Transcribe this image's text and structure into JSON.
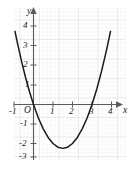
{
  "figure": {
    "background_color": "#ffffff",
    "grid_minor_color": "#e8e8e8",
    "grid_major_color": "#d0d0d0",
    "axis_color": "#5a5a5a",
    "curve_color": "#1a1a1a"
  },
  "chart_data": {
    "type": "line",
    "title": "",
    "subtitle": "",
    "xlabel": "x",
    "ylabel": "y",
    "origin_label": "O",
    "xlim": [
      -1.35,
      4.55
    ],
    "ylim": [
      -3.2,
      4.7
    ],
    "grid": true,
    "grid_minor_step": 0.2,
    "grid_major_step": 1,
    "legend": "none",
    "x_ticks": [
      -1,
      1,
      2,
      3,
      4
    ],
    "x_tick_labels": [
      "-1",
      "1",
      "2",
      "3",
      "4"
    ],
    "y_ticks": [
      -3,
      -2,
      -1,
      1,
      2,
      3,
      4
    ],
    "y_tick_labels": [
      "-3",
      "-2",
      "-1",
      "1",
      "2",
      "3",
      "4"
    ],
    "series": [
      {
        "name": "y = x^2 - 3x",
        "equation": "y = x^2 - 3x",
        "vertex": [
          1.5,
          -2.25
        ],
        "x_intercepts": [
          0,
          3
        ],
        "y_intercept": 0,
        "x": [
          -0.95,
          -0.8,
          -0.6,
          -0.4,
          -0.2,
          0,
          0.25,
          0.5,
          0.75,
          1,
          1.25,
          1.5,
          1.75,
          2,
          2.25,
          2.5,
          2.75,
          3,
          3.25,
          3.5,
          3.75,
          3.95
        ],
        "values": [
          3.75,
          3.04,
          2.16,
          1.36,
          0.64,
          0,
          -0.69,
          -1.25,
          -1.69,
          -2,
          -2.19,
          -2.25,
          -2.19,
          -2,
          -1.69,
          -1.25,
          -0.69,
          0,
          0.81,
          1.75,
          2.81,
          3.75
        ]
      }
    ],
    "annotations": []
  },
  "axes": {
    "x_axis_arrow": "arrow-right",
    "y_axis_arrow": "arrow-up",
    "x_label": "x",
    "y_label": "y"
  }
}
